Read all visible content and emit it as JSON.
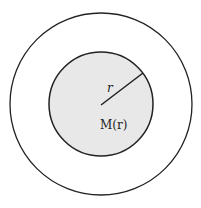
{
  "diagram": {
    "outer_circle": {
      "cx": 101,
      "cy": 104,
      "r": 91,
      "fill": "#ffffff",
      "stroke": "#222222"
    },
    "inner_circle": {
      "cx": 101,
      "cy": 104,
      "r": 52,
      "fill": "#e8e8e8",
      "stroke": "#222222"
    },
    "radius_line": {
      "x1": 101,
      "y1": 105,
      "x2": 143,
      "y2": 73
    },
    "labels": {
      "radius": "r",
      "mass": "M(r)"
    }
  }
}
